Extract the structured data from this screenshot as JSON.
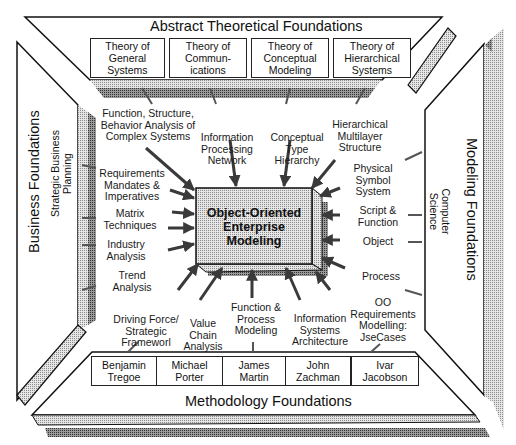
{
  "diagram": {
    "center": {
      "line1": "Object-Oriented",
      "line2": "Enterprise",
      "line3": "Modeling"
    },
    "frames": {
      "top": "Abstract Theoretical Foundations",
      "left": "Business Foundations",
      "right": "Modeling Foundations",
      "bottom": "Methodology Foundations"
    },
    "side_subtitles": {
      "left": {
        "line1": "Strategic Business",
        "line2": "Planning"
      },
      "right": {
        "line1": "Computer",
        "line2": "Science"
      }
    },
    "top_boxes": [
      {
        "line1": "Theory of",
        "line2": "General",
        "line3": "Systems"
      },
      {
        "line1": "Theory of",
        "line2": "Commun-",
        "line3": "ications"
      },
      {
        "line1": "Theory of",
        "line2": "Conceptual",
        "line3": "Modeling"
      },
      {
        "line1": "Theory of",
        "line2": "Hierarchical",
        "line3": "Systems"
      }
    ],
    "bottom_boxes": [
      {
        "line1": "Benjamin",
        "line2": "Tregoe"
      },
      {
        "line1": "Michael",
        "line2": "Porter"
      },
      {
        "line1": "James",
        "line2": "Martin"
      },
      {
        "line1": "John",
        "line2": "Zachman"
      },
      {
        "line1": "Ivar",
        "line2": "Jacobson"
      }
    ],
    "inner_labels": {
      "fsb": {
        "line1": "Function, Structure,",
        "line2": "Behavior Analysis of",
        "line3": "Complex Systems"
      },
      "ipn": {
        "line1": "Information",
        "line2": "Processing",
        "line3": "Network"
      },
      "cth": {
        "line1": "Conceptual",
        "line2": "Type",
        "line3": "Hierarchy"
      },
      "hms": {
        "line1": "Hierarchical",
        "line2": "Multilayer",
        "line3": "Structure"
      },
      "rmi": {
        "line1": "Requirements",
        "line2": "Mandates &",
        "line3": "Imperatives"
      },
      "mt": {
        "line1": "Matrix",
        "line2": "Techniques"
      },
      "ia": {
        "line1": "Industry",
        "line2": "Analysis"
      },
      "ta": {
        "line1": "Trend",
        "line2": "Analysis"
      },
      "pss": {
        "line1": "Physical",
        "line2": "Symbol",
        "line3": "System"
      },
      "sf": {
        "line1": "Script &",
        "line2": "Function"
      },
      "obj": {
        "line1": "Object"
      },
      "proc": {
        "line1": "Process"
      },
      "oor": {
        "line1": "OO",
        "line2": "Requirements",
        "line3": "Modelling:",
        "line4": "JseCases"
      },
      "dfs": {
        "line1": "Driving Force/",
        "line2": "Strategic",
        "line3": "Frameworl"
      },
      "vca": {
        "line1": "Value",
        "line2": "Chain",
        "line3": "Analysis"
      },
      "fpm": {
        "line1": "Function &",
        "line2": "Process",
        "line3": "Modeling"
      },
      "isa": {
        "line1": "Information",
        "line2": "Systems",
        "line3": "Architecture"
      }
    },
    "colors": {
      "frame_fill": "#ffffff",
      "stroke": "#111111",
      "shade_light": "#c8c8c8",
      "shade_dark": "#8a8a8a",
      "arrow": "#4a4a4a",
      "center_fill": "#cfcfcf"
    }
  }
}
